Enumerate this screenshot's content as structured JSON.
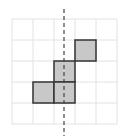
{
  "diagram": {
    "grid": {
      "x0": 12,
      "y0": 19,
      "cell": 21,
      "cols": 5,
      "rows": 5,
      "line_color": "#e2e2e2"
    },
    "cells": [
      {
        "col": 3,
        "row": 1
      },
      {
        "col": 2,
        "row": 2
      },
      {
        "col": 1,
        "row": 3
      },
      {
        "col": 2,
        "row": 3
      }
    ],
    "cell_fill": "#c8c8c8",
    "cell_stroke": "#333333",
    "axis_line": {
      "x": 64,
      "y1": 9,
      "y2": 136,
      "color": "#444444",
      "style": "dashed"
    }
  }
}
